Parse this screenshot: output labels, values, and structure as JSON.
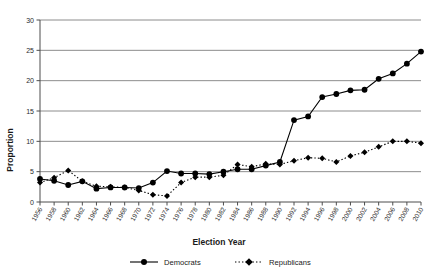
{
  "chart_data": {
    "type": "line",
    "title": "",
    "xlabel": "Election Year",
    "ylabel": "Proportion",
    "xlim": [
      1956,
      2010
    ],
    "ylim": [
      0,
      30
    ],
    "ytick_step": 5,
    "yticks": [
      0,
      5,
      10,
      15,
      20,
      25,
      30
    ],
    "grid": "horizontal",
    "legend_position": "bottom",
    "categories": [
      1956,
      1958,
      1960,
      1962,
      1964,
      1966,
      1968,
      1970,
      1972,
      1974,
      1976,
      1978,
      1980,
      1982,
      1984,
      1986,
      1988,
      1990,
      1992,
      1994,
      1996,
      1998,
      2000,
      2002,
      2004,
      2006,
      2008,
      2010
    ],
    "series": [
      {
        "name": "Democrats",
        "marker": "circle",
        "linestyle": "solid",
        "color": "#000000",
        "values": [
          3.8,
          3.5,
          2.8,
          3.4,
          2.2,
          2.4,
          2.4,
          2.3,
          3.2,
          5.1,
          4.7,
          4.7,
          4.6,
          5.0,
          5.4,
          5.4,
          6.0,
          6.6,
          13.5,
          14.1,
          17.3,
          17.8,
          18.4,
          18.5,
          20.3,
          21.2,
          22.8,
          24.8
        ]
      },
      {
        "name": "Republicans",
        "marker": "diamond",
        "linestyle": "dotted",
        "color": "#000000",
        "values": [
          3.2,
          4.0,
          5.2,
          3.4,
          2.6,
          2.5,
          2.4,
          1.9,
          1.2,
          1.0,
          3.2,
          4.1,
          4.1,
          4.4,
          6.2,
          5.8,
          6.3,
          6.2,
          6.8,
          7.3,
          7.2,
          6.6,
          7.6,
          8.2,
          9.1,
          10.0,
          10.0,
          9.7
        ]
      }
    ]
  },
  "legend": {
    "items": [
      {
        "label": "Democrats"
      },
      {
        "label": "Republicans"
      }
    ]
  }
}
